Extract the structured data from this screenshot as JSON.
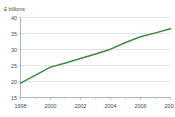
{
  "figure": {
    "partial_title": "",
    "y_unit_label": "£ billions"
  },
  "chart_data": {
    "type": "line",
    "title": "",
    "xlabel": "",
    "ylabel": "£ billions",
    "ylim": [
      15,
      40
    ],
    "xlim": [
      1998,
      2008
    ],
    "ytick_labels": [
      "40",
      "35",
      "30",
      "25",
      "20",
      "15"
    ],
    "yticks": [
      40,
      35,
      30,
      25,
      20,
      15
    ],
    "xtick_labels": [
      "1998",
      "2000",
      "2002",
      "2004",
      "2006",
      "2008"
    ],
    "xticks": [
      1998,
      2000,
      2002,
      2004,
      2006,
      2008
    ],
    "minor_xticks": [
      1999,
      2001,
      2003,
      2005,
      2007
    ],
    "grid": "horizontal",
    "legend": "none",
    "series": [
      {
        "name": "£ billions",
        "color": "#3f8a3f",
        "x": [
          1998,
          1999,
          2000,
          2001,
          2002,
          2003,
          2004,
          2005,
          2006,
          2007,
          2008
        ],
        "values": [
          19.5,
          22.0,
          24.5,
          25.8,
          27.2,
          28.6,
          30.1,
          32.2,
          34.0,
          35.2,
          36.5
        ]
      }
    ]
  }
}
